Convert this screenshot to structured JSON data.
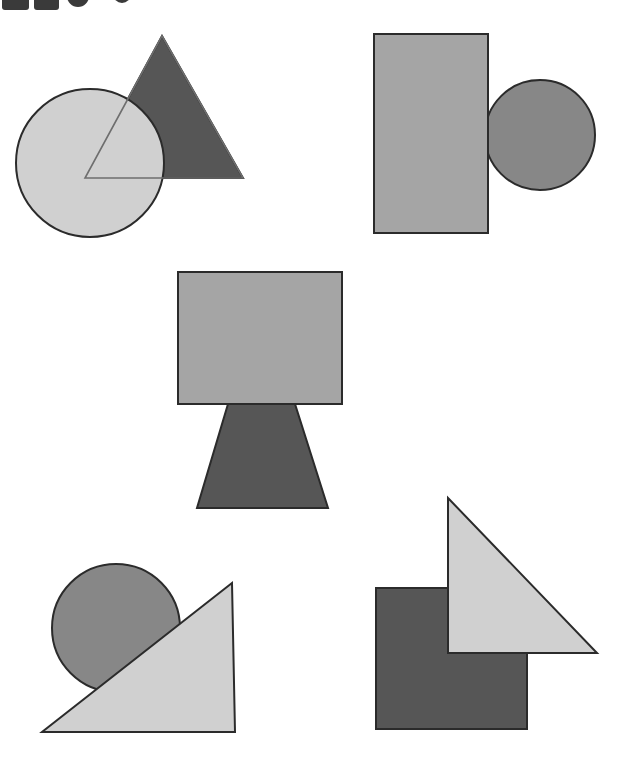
{
  "canvas": {
    "width": 631,
    "height": 776,
    "background": "#ffffff",
    "title": "Overlapping geometric shapes"
  },
  "palette": {
    "light_gray": "#d0d0d0",
    "medium_light_gray": "#a5a5a5",
    "medium_gray": "#878787",
    "dark_gray": "#565656",
    "outline": "#2b2b2b",
    "icon_dark": "#3a3a3a",
    "white": "#ffffff"
  },
  "top_icon_strip": {
    "description": "Row of dark shapes clipped by the top edge of the screenshot",
    "clipped": true,
    "items": [
      {
        "name": "rounded-rect-1",
        "shape": "rounded-rectangle",
        "x": 2,
        "y": -12,
        "width": 27,
        "height": 22,
        "fill": "#3a3a3a"
      },
      {
        "name": "rounded-rect-2",
        "shape": "rounded-rectangle",
        "x": 34,
        "y": -12,
        "width": 25,
        "height": 22,
        "fill": "#3a3a3a"
      },
      {
        "name": "circle-1",
        "shape": "circle",
        "cx": 78,
        "cy": -4,
        "r": 11,
        "fill": "#3a3a3a"
      },
      {
        "name": "circle-2",
        "shape": "circle",
        "cx": 122,
        "cy": -6,
        "r": 9,
        "fill": "#3a3a3a"
      }
    ]
  },
  "groups": [
    {
      "id": "group-top-left",
      "label": "Circle over triangle",
      "shapes": [
        {
          "name": "triangle",
          "type": "triangle",
          "points": "162,36 243,178 85,178",
          "fill": "#565656",
          "stroke": "#2b2b2b",
          "stroke_width": 2,
          "z": 1
        },
        {
          "name": "circle",
          "type": "circle",
          "cx": 90,
          "cy": 163,
          "r": 74,
          "fill": "#d0d0d0",
          "stroke": "#2b2b2b",
          "stroke_width": 2,
          "z": 2
        },
        {
          "name": "triangle-outline-overlay",
          "type": "triangle-outline",
          "points": "162,36 243,178 85,178",
          "fill": "none",
          "stroke": "#6e6e6e",
          "stroke_width": 1.6,
          "z": 3
        }
      ]
    },
    {
      "id": "group-top-right",
      "label": "Rectangle over circle",
      "shapes": [
        {
          "name": "circle",
          "type": "circle",
          "cx": 540,
          "cy": 135,
          "r": 55,
          "fill": "#878787",
          "stroke": "#2b2b2b",
          "stroke_width": 2,
          "z": 1
        },
        {
          "name": "rectangle",
          "type": "rect",
          "x": 374,
          "y": 34,
          "width": 114,
          "height": 199,
          "fill": "#a5a5a5",
          "stroke": "#2b2b2b",
          "stroke_width": 2,
          "z": 2
        }
      ]
    },
    {
      "id": "group-middle",
      "label": "Rectangle over inverted trapezoid",
      "shapes": [
        {
          "name": "trapezoid",
          "type": "polygon",
          "points": "228,404 295,404 328,508 197,508",
          "fill": "#565656",
          "stroke": "#2b2b2b",
          "stroke_width": 2,
          "z": 1
        },
        {
          "name": "rectangle",
          "type": "rect",
          "x": 178,
          "y": 272,
          "width": 164,
          "height": 132,
          "fill": "#a5a5a5",
          "stroke": "#2b2b2b",
          "stroke_width": 2,
          "z": 2
        }
      ]
    },
    {
      "id": "group-bottom-left",
      "label": "Triangle over circle",
      "shapes": [
        {
          "name": "circle",
          "type": "circle",
          "cx": 116,
          "cy": 628,
          "r": 64,
          "fill": "#878787",
          "stroke": "#2b2b2b",
          "stroke_width": 2,
          "z": 1
        },
        {
          "name": "triangle",
          "type": "triangle",
          "points": "232,583 235,732 42,732",
          "fill": "#d0d0d0",
          "stroke": "#2b2b2b",
          "stroke_width": 2,
          "z": 2
        }
      ]
    },
    {
      "id": "group-bottom-right",
      "label": "Triangle over square",
      "shapes": [
        {
          "name": "square",
          "type": "rect",
          "x": 376,
          "y": 588,
          "width": 151,
          "height": 141,
          "fill": "#565656",
          "stroke": "#2b2b2b",
          "stroke_width": 2,
          "z": 1
        },
        {
          "name": "triangle",
          "type": "triangle",
          "points": "448,498 597,653 448,653",
          "fill": "#d0d0d0",
          "stroke": "#2b2b2b",
          "stroke_width": 2,
          "z": 2
        }
      ]
    }
  ]
}
